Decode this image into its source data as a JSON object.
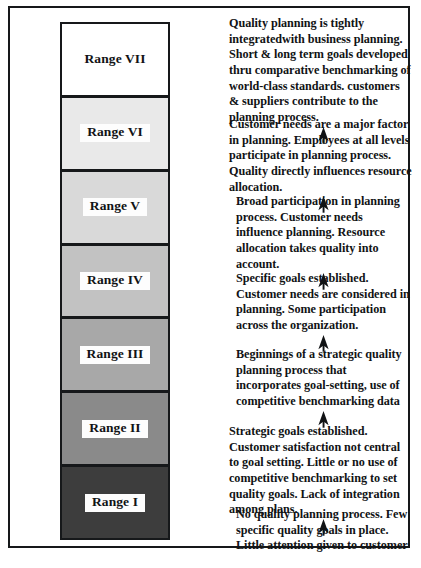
{
  "figure": {
    "border_color": "#16181a",
    "background_color": "#ffffff"
  },
  "ranges": [
    {
      "label": "Range VII",
      "fill": "#ffffff",
      "level": 7
    },
    {
      "label": "Range VI",
      "fill": "#e9e9e9",
      "level": 6
    },
    {
      "label": "Range V",
      "fill": "#d9d9d9",
      "level": 5
    },
    {
      "label": "Range IV",
      "fill": "#c2c2c2",
      "level": 4
    },
    {
      "label": "Range III",
      "fill": "#a8a8a8",
      "level": 3
    },
    {
      "label": "Range II",
      "fill": "#8a8a8a",
      "level": 2
    },
    {
      "label": "Range I",
      "fill": "#3d3d3d",
      "level": 1
    }
  ],
  "descriptions": [
    {
      "for_range": "Range VII",
      "text": "Quality planning is tightly integratedwith business planning. Short & long term goals developed thru comparative benchmarking of world-class standards. customers & suppliers contribute to the planning process."
    },
    {
      "for_range": "Range VI",
      "text": "Customer needs are a major factor in planning. Employees at all levels participate in planning process. Quality directly influences resource allocation."
    },
    {
      "for_range": "Range V",
      "text": "Broad participation in planning process. Customer needs influence planning.  Resource allocation takes quality into account."
    },
    {
      "for_range": "Range IV",
      "text": "Specific goals  established. Customer needs are considered in planning.  Some participation across the organization."
    },
    {
      "for_range": "Range III",
      "text": "Beginnings of a  strategic quality planning process that incorporates goal-setting, use of competitive benchmarking data"
    },
    {
      "for_range": "Range II",
      "text": "Strategic goals established. Customer satisfaction not central to goal setting.  Little or no use of competitive benchmarking to set quality goals. Lack of integration among plans."
    },
    {
      "for_range": "Range I",
      "text": "No quality planning process. Few specific quality goals in place. Little attention given to customer satisfaction."
    }
  ],
  "arrows": {
    "glyph": "up-arrow",
    "count": 6,
    "color": "#111315",
    "meaning": "progression upward to next maturity range"
  }
}
